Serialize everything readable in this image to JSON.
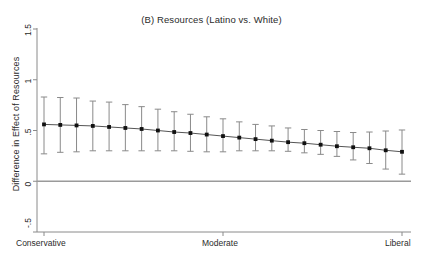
{
  "chart_data": {
    "type": "line",
    "title": "(B) Resources (Latino vs. White)",
    "xlabel": "",
    "ylabel": "Difference in Effect of Resources",
    "ylim": [
      -0.5,
      1.5
    ],
    "yticks": [
      -0.5,
      0,
      0.5,
      1,
      1.5
    ],
    "ytick_labels": [
      "-.5",
      "0",
      ".5",
      "1",
      "1.5"
    ],
    "xtick_labels": [
      "Conservative",
      "Moderate",
      "Liberal"
    ],
    "xtick_positions": [
      0,
      11,
      22
    ],
    "grid": false,
    "legend": null,
    "zero_reference_line": 0,
    "x": [
      0,
      1,
      2,
      3,
      4,
      5,
      6,
      7,
      8,
      9,
      10,
      11,
      12,
      13,
      14,
      15,
      16,
      17,
      18,
      19,
      20,
      21,
      22
    ],
    "series": [
      {
        "name": "Difference in Effect of Resources",
        "marker": "square",
        "values": [
          0.56,
          0.555,
          0.55,
          0.545,
          0.535,
          0.525,
          0.515,
          0.5,
          0.485,
          0.475,
          0.46,
          0.445,
          0.43,
          0.415,
          0.4,
          0.385,
          0.375,
          0.36,
          0.345,
          0.335,
          0.325,
          0.305,
          0.29
        ],
        "ci_lower": [
          0.27,
          0.285,
          0.29,
          0.3,
          0.3,
          0.3,
          0.3,
          0.3,
          0.3,
          0.295,
          0.29,
          0.29,
          0.3,
          0.3,
          0.3,
          0.295,
          0.28,
          0.265,
          0.245,
          0.21,
          0.175,
          0.12,
          0.07
        ],
        "ci_upper": [
          0.83,
          0.825,
          0.82,
          0.79,
          0.78,
          0.755,
          0.735,
          0.71,
          0.685,
          0.66,
          0.635,
          0.615,
          0.585,
          0.56,
          0.545,
          0.525,
          0.51,
          0.5,
          0.49,
          0.48,
          0.485,
          0.495,
          0.505
        ]
      }
    ]
  },
  "axes": {
    "plot_left": 37,
    "plot_right": 409,
    "plot_top": 29,
    "plot_bottom": 232,
    "y_value_top": 1.5,
    "y_value_bottom": -0.5,
    "colors": {
      "line": "#555555",
      "marker": "#111111",
      "error_bar": "#8a8a8a",
      "axis": "#8a8a8a",
      "zero_line": "#9a9a9a",
      "text": "#2b2b2b",
      "background": "#ffffff"
    }
  }
}
